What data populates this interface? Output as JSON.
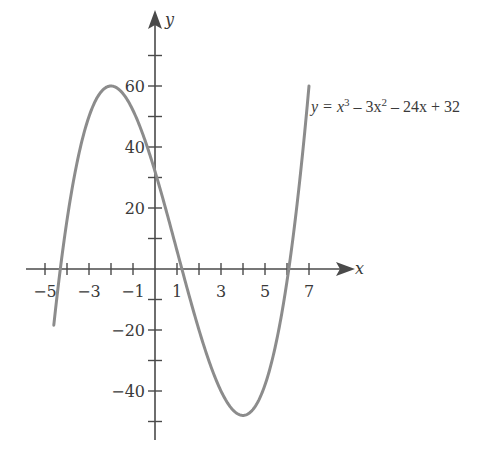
{
  "chart_data": {
    "type": "line",
    "title": "",
    "function": "y = x^3 - 3x^2 - 24x + 32",
    "equation_label": {
      "prefix": "y = x",
      "exp1": "3",
      "mid1": " – 3x",
      "exp2": "2",
      "rest": " – 24x + 32"
    },
    "xlabel": "x",
    "ylabel": "y",
    "x_range": [
      -4.6,
      7.0
    ],
    "xlim": [
      -5.5,
      8.5
    ],
    "ylim": [
      -55,
      85
    ],
    "x_tick_labels": [
      "−5",
      "−3",
      "−1",
      "1",
      "3",
      "5",
      "7"
    ],
    "x_tick_values": [
      -5,
      -3,
      -1,
      1,
      3,
      5,
      7
    ],
    "x_minor_ticks": [
      -5,
      -4,
      -3,
      -2,
      -1,
      1,
      2,
      3,
      4,
      5,
      6,
      7
    ],
    "y_tick_labels": [
      "60",
      "40",
      "20",
      "−20",
      "−40"
    ],
    "y_tick_values": [
      60,
      40,
      20,
      -20,
      -40
    ],
    "y_minor_ticks": [
      70,
      60,
      50,
      40,
      30,
      20,
      10,
      -10,
      -20,
      -30,
      -40,
      -50
    ],
    "key_points": [
      {
        "x": -2,
        "y": 60,
        "note": "local max"
      },
      {
        "x": 4,
        "y": -48,
        "note": "local min"
      },
      {
        "x": 0,
        "y": 32,
        "note": "y-intercept"
      },
      {
        "x": -4.3,
        "y": 0,
        "note": "root"
      },
      {
        "x": 1.2,
        "y": 0,
        "note": "root"
      },
      {
        "x": 6.1,
        "y": 0,
        "note": "root"
      }
    ],
    "grid": false,
    "legend": "none",
    "colors": {
      "curve": "#8c8c8c",
      "axis": "#4a4a4a"
    }
  }
}
